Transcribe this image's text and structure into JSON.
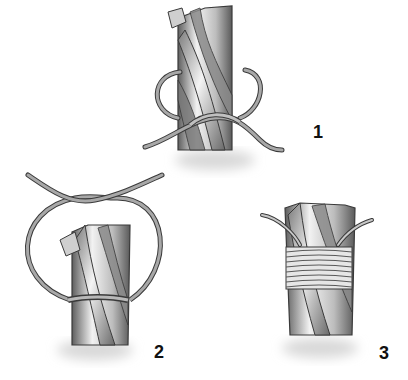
{
  "diagram": {
    "steps": [
      {
        "label": "1",
        "description": "Loop of twine laid along rope end, crossing below"
      },
      {
        "label": "2",
        "description": "Large loop over frayed end, twisted at top"
      },
      {
        "label": "3",
        "description": "Tight wraps of twine finishing the whipping"
      }
    ]
  },
  "colors": {
    "background": "#ffffff",
    "rope_light": "#e8e8e8",
    "rope_dark": "#6a6a6a",
    "twine": "#9a9a9a",
    "outline": "#3a3a3a",
    "label": "#111111"
  }
}
